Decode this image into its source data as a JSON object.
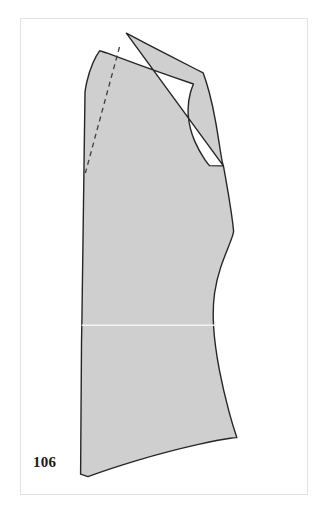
{
  "plate": {
    "number_label": "106",
    "caption": "",
    "background_color": "#ffffff",
    "frame_color": "#e3e3e3"
  },
  "figure": {
    "type": "sewing-pattern-block",
    "piece_name": "bodice-front-block",
    "fill_color": "#cfcfcf",
    "outline_color": "#262626",
    "outline_width": 1.4,
    "seamline_color": "#3a3a3a",
    "guideline_color": "#f2f2f2",
    "outline_path": "M 126.5 33.5 L 203.5 73.5 C 212.5 98.5 219.5 131.5 224.5 165.5 L 209.5 165.0 C 200.5 152.0 192.5 138.5 190.5 120.5 C 188.5 103.0 190.0 89.5 193.5 78.5 L 126.5 33.5 Z",
    "shapes": {
      "body": {
        "name": "pattern-body-outline",
        "description": "Main outline of the bodice front with neckline, shoulder, armhole, side seam and flared hem.",
        "path": "M 126.2 33.2 L 202.8 73.0 C 210.5 92.0 217.0 113.0 221.5 134.5 C 223.2 143.0 224.4 152.0 225.2 160.2 L 208.0 161.5 C 203.0 157.5 198.5 152.0 195.0 145.0 C 190.5 136.0 187.5 125.5 186.5 113.5 C 185.5 101.0 187.0 91.0 190.0 83.0 L 126.2 33.2 Z"
      },
      "seamline_lower": {
        "name": "waist-guideline",
        "y": 325.5,
        "x_start": 81.0,
        "x_end": 215.0
      },
      "dart_line": {
        "name": "shoulder-dart-dashed-line",
        "x1": 120.0,
        "y1": 48.0,
        "x2": 85.5,
        "y2": 173.0,
        "dash": "5 4"
      }
    }
  }
}
